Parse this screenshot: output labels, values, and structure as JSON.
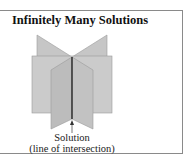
{
  "figure": {
    "title": "Infinitely Many Solutions",
    "caption_line1": "Solution",
    "caption_line2": "(line of intersection)",
    "colors": {
      "border": "#8a8a8a",
      "back_plane": "#c6c6c6",
      "middle_plane": "#cbcbcb",
      "front_plane": "#bcbcbc",
      "plane_edge": "#9a9a9a",
      "intersection_line": "#111111",
      "arrow": "#555555"
    }
  }
}
